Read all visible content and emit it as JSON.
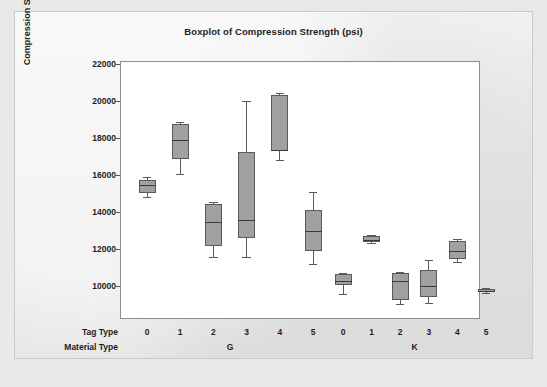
{
  "chart_data": {
    "type": "box",
    "title": "Boxplot of Compression Strength (psi)",
    "ylabel": "Compression Strength (psi)",
    "xlabel_rows": [
      "Tag Type",
      "Material Type"
    ],
    "ylim": [
      9000,
      22000
    ],
    "yticks": [
      22000,
      20000,
      18000,
      16000,
      14000,
      12000,
      10000
    ],
    "ytick_labels": [
      "22000",
      "20000",
      "18000",
      "16000",
      "14000",
      "12000",
      "10000"
    ],
    "grid": false,
    "legend": "none",
    "group_labels": [
      "G",
      "K"
    ],
    "categories": [
      "0",
      "1",
      "2",
      "3",
      "4",
      "5",
      "0",
      "1",
      "2",
      "3",
      "4",
      "5"
    ],
    "boxes": [
      {
        "material": "G",
        "tag": "0",
        "whisker_low": 14850,
        "q1": 15100,
        "median": 15550,
        "q3": 15800,
        "whisker_high": 15950
      },
      {
        "material": "G",
        "tag": "1",
        "whisker_low": 16100,
        "q1": 16950,
        "median": 17950,
        "q3": 18800,
        "whisker_high": 18900
      },
      {
        "material": "G",
        "tag": "2",
        "whisker_low": 11650,
        "q1": 12250,
        "median": 13550,
        "q3": 14500,
        "whisker_high": 14600
      },
      {
        "material": "G",
        "tag": "3",
        "whisker_low": 11650,
        "q1": 12650,
        "median": 13650,
        "q3": 17300,
        "whisker_high": 20050
      },
      {
        "material": "G",
        "tag": "4",
        "whisker_low": 16850,
        "q1": 17350,
        "median": 17400,
        "q3": 20400,
        "whisker_high": 20500
      },
      {
        "material": "G",
        "tag": "5",
        "whisker_low": 11250,
        "q1": 11950,
        "median": 13050,
        "q3": 14150,
        "whisker_high": 15150
      },
      {
        "material": "K",
        "tag": "0",
        "whisker_low": 9650,
        "q1": 10150,
        "median": 10350,
        "q3": 10700,
        "whisker_high": 10750
      },
      {
        "material": "K",
        "tag": "1",
        "whisker_low": 12400,
        "q1": 12450,
        "median": 12550,
        "q3": 12750,
        "whisker_high": 12850
      },
      {
        "material": "K",
        "tag": "2",
        "whisker_low": 9100,
        "q1": 9300,
        "median": 10350,
        "q3": 10800,
        "whisker_high": 10850
      },
      {
        "material": "K",
        "tag": "3",
        "whisker_low": 9150,
        "q1": 9500,
        "median": 10100,
        "q3": 10950,
        "whisker_high": 11450
      },
      {
        "material": "K",
        "tag": "4",
        "whisker_low": 11350,
        "q1": 11550,
        "median": 11950,
        "q3": 12500,
        "whisker_high": 12600
      },
      {
        "material": "K",
        "tag": "5",
        "whisker_low": 9700,
        "q1": 9750,
        "median": 9800,
        "q3": 9900,
        "whisker_high": 9950
      }
    ],
    "colors": {
      "box_fill": "#a0a0a0",
      "box_edge": "#5a5a5a",
      "median": "#3a3a3a",
      "plot_background": "#ffffff",
      "page_background": "#ececec",
      "text": "#1d1d1d"
    }
  }
}
